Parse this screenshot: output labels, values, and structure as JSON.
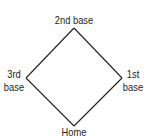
{
  "diagram": {
    "bases": {
      "second": {
        "line1": "2nd base"
      },
      "third": {
        "line1": "3rd",
        "line2": "base"
      },
      "first": {
        "line1": "1st",
        "line2": "base"
      },
      "home": {
        "line1": "Home"
      }
    },
    "colors": {
      "line": "#231f20",
      "text": "#231f20",
      "background": "#ffffff"
    }
  }
}
